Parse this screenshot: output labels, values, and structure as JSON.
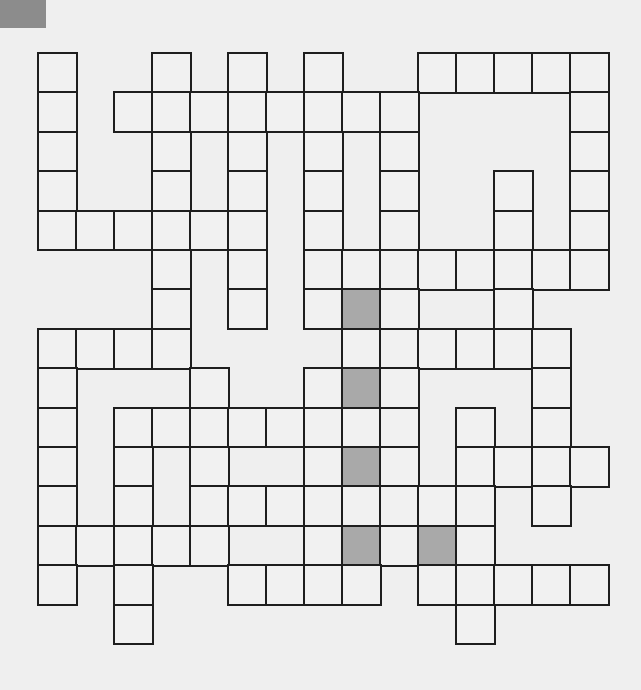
{
  "puzzle": {
    "rows": 15,
    "cols": 15,
    "cell_width": 38,
    "cell_height": 39.4,
    "colors": {
      "background": "#efefef",
      "cell": "#f1f1f1",
      "shaded_cell": "#a9a9a9",
      "border": "#1e1e1e",
      "corner_block": "#8c8c8c"
    },
    "grid": [
      {
        "row": 0,
        "cells": [
          0,
          3,
          5,
          7,
          10,
          11,
          12,
          13,
          14
        ],
        "shaded": []
      },
      {
        "row": 1,
        "cells": [
          0,
          2,
          3,
          4,
          5,
          6,
          7,
          8,
          9,
          14
        ],
        "shaded": []
      },
      {
        "row": 2,
        "cells": [
          0,
          3,
          5,
          7,
          9,
          14
        ],
        "shaded": []
      },
      {
        "row": 3,
        "cells": [
          0,
          3,
          5,
          7,
          9,
          12,
          14
        ],
        "shaded": []
      },
      {
        "row": 4,
        "cells": [
          0,
          1,
          2,
          3,
          4,
          5,
          7,
          9,
          12,
          14
        ],
        "shaded": []
      },
      {
        "row": 5,
        "cells": [
          3,
          5,
          7,
          8,
          9,
          10,
          11,
          12,
          13,
          14
        ],
        "shaded": []
      },
      {
        "row": 6,
        "cells": [
          3,
          5,
          7,
          8,
          9,
          12
        ],
        "shaded": [
          8
        ]
      },
      {
        "row": 7,
        "cells": [
          0,
          1,
          2,
          3,
          8,
          9,
          10,
          11,
          12,
          13
        ],
        "shaded": []
      },
      {
        "row": 8,
        "cells": [
          0,
          4,
          7,
          8,
          9,
          13
        ],
        "shaded": [
          8
        ]
      },
      {
        "row": 9,
        "cells": [
          0,
          2,
          3,
          4,
          5,
          6,
          7,
          8,
          9,
          11,
          13
        ],
        "shaded": []
      },
      {
        "row": 10,
        "cells": [
          0,
          2,
          4,
          7,
          8,
          9,
          11,
          12,
          13,
          14
        ],
        "shaded": [
          8
        ]
      },
      {
        "row": 11,
        "cells": [
          0,
          2,
          4,
          5,
          6,
          7,
          8,
          9,
          10,
          11,
          13
        ],
        "shaded": []
      },
      {
        "row": 12,
        "cells": [
          0,
          1,
          2,
          3,
          4,
          7,
          8,
          9,
          10,
          11
        ],
        "shaded": [
          8,
          10
        ]
      },
      {
        "row": 13,
        "cells": [
          0,
          2,
          5,
          6,
          7,
          8,
          10,
          11,
          12,
          13,
          14
        ],
        "shaded": []
      },
      {
        "row": 14,
        "cells": [
          2,
          11
        ],
        "shaded": []
      }
    ]
  }
}
